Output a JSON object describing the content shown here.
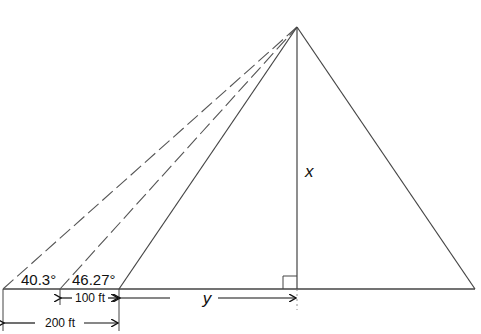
{
  "diagram": {
    "title": "",
    "labels": {
      "angle_far": "40.3°",
      "angle_near": "46.27°",
      "height_var": "x",
      "base_var": "y",
      "dist_100": "100 ft",
      "dist_200": "200 ft"
    },
    "geometry": {
      "apex": [
        297,
        27
      ],
      "altitude_foot": [
        297,
        289
      ],
      "base_left": [
        3,
        289
      ],
      "base_right": [
        475,
        289
      ],
      "observer_far": [
        3,
        289
      ],
      "observer_mid": [
        60,
        289
      ],
      "observer_near": [
        119,
        289
      ]
    },
    "lines": [
      {
        "name": "sight-line-far",
        "style": "dashed",
        "from": "observer_far",
        "to": "apex"
      },
      {
        "name": "sight-line-mid",
        "style": "dashed",
        "from": "observer_mid",
        "to": "apex"
      },
      {
        "name": "sight-line-near",
        "style": "solid",
        "from": "observer_near",
        "to": "apex"
      },
      {
        "name": "altitude",
        "style": "solid",
        "from": "apex",
        "to": "altitude_foot"
      },
      {
        "name": "right-side",
        "style": "solid",
        "from": "apex",
        "to": "base_right"
      }
    ],
    "colors": {
      "stroke": "#333333",
      "text": "#111111",
      "background": "#ffffff"
    }
  }
}
